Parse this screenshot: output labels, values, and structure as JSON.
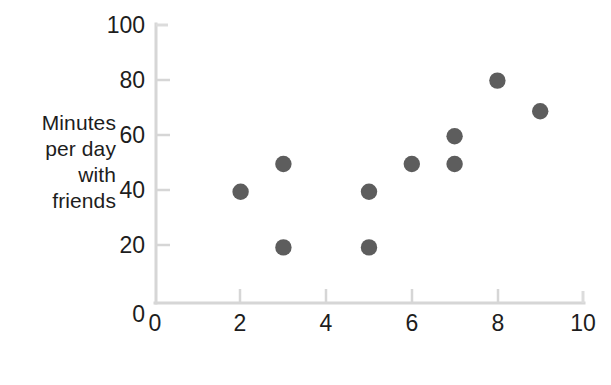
{
  "chart_data": {
    "type": "scatter",
    "title": "",
    "xlabel": "Happiness",
    "ylabel": "Minutes per day with friends",
    "ylabel_lines": [
      "Minutes",
      "per day",
      "with",
      "friends"
    ],
    "xlim": [
      0,
      10
    ],
    "ylim": [
      0,
      100
    ],
    "xticks": [
      0,
      2,
      4,
      6,
      8,
      10
    ],
    "yticks": [
      0,
      20,
      40,
      60,
      80,
      100
    ],
    "xtick_labels": [
      "0",
      "2",
      "4",
      "6",
      "8",
      "10"
    ],
    "ytick_labels": [
      "0",
      "20",
      "40",
      "60",
      "80",
      "100"
    ],
    "grid": false,
    "legend": null,
    "series": [
      {
        "name": "observations",
        "marker": "circle",
        "color": "#5d5d5d",
        "points": [
          {
            "x": 2,
            "y": 40
          },
          {
            "x": 3,
            "y": 50
          },
          {
            "x": 3,
            "y": 20
          },
          {
            "x": 5,
            "y": 40
          },
          {
            "x": 5,
            "y": 20
          },
          {
            "x": 6,
            "y": 50
          },
          {
            "x": 7,
            "y": 60
          },
          {
            "x": 7,
            "y": 50
          },
          {
            "x": 8,
            "y": 80
          },
          {
            "x": 9,
            "y": 69
          }
        ]
      }
    ]
  },
  "style": {
    "background": "#ffffff",
    "axis_color": "#d4d4d4",
    "tick_color": "#cfcfcf",
    "marker_color": "#5d5d5d",
    "text_color": "#1d1d1d"
  }
}
